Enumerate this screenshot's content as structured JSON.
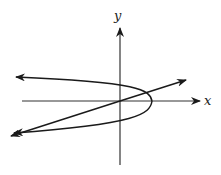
{
  "figure": {
    "type": "coordinate-plane-sketch",
    "axes": {
      "x_label": "x",
      "y_label": "y"
    },
    "curves": [
      {
        "name": "parabola",
        "description": "left-opening parabola with vertex on positive x-axis"
      },
      {
        "name": "line",
        "description": "line through origin with positive slope"
      }
    ],
    "colors": {
      "stroke": "#1a1a1a",
      "background": "#ffffff"
    }
  }
}
